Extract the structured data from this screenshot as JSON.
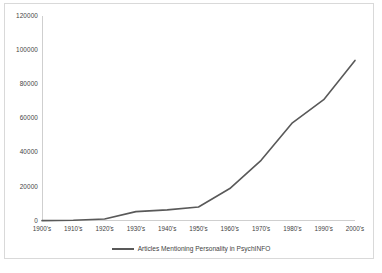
{
  "chart_data": {
    "type": "line",
    "title": "",
    "xlabel": "",
    "ylabel": "",
    "categories": [
      "1900's",
      "1910's",
      "1920's",
      "1930's",
      "1940's",
      "1950's",
      "1960's",
      "1970's",
      "1980's",
      "1990's",
      "2000's"
    ],
    "series": [
      {
        "name": "Articles Mentioning Personality in PsychINFO",
        "color": "#595959",
        "values": [
          200,
          400,
          1200,
          5500,
          6500,
          8200,
          19000,
          35500,
          57500,
          71000,
          94000
        ]
      }
    ],
    "ylim": [
      0,
      120000
    ],
    "yticks": [
      0,
      20000,
      40000,
      60000,
      80000,
      100000,
      120000
    ],
    "ytick_labels": [
      "0",
      "20000",
      "40000",
      "60000",
      "80000",
      "100000",
      "120000"
    ],
    "grid": false,
    "legend_position": "bottom"
  },
  "legend": {
    "entries": [
      {
        "label": "Articles Mentioning Personality in PsychINFO",
        "color": "#595959"
      }
    ]
  }
}
